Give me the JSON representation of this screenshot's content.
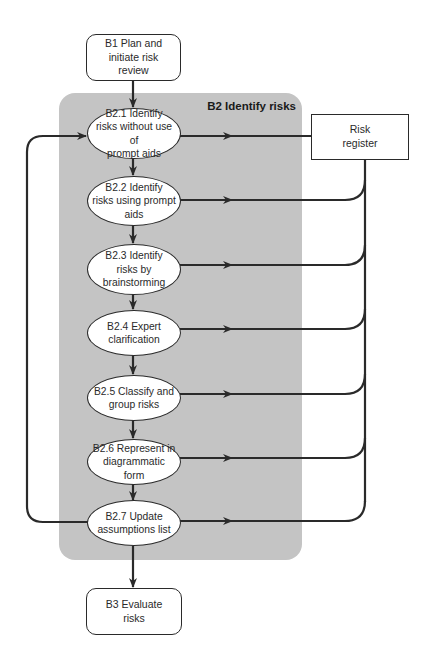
{
  "diagram": {
    "group": {
      "title": "B2 Identify risks",
      "background_color": "#c4c4c4"
    },
    "start_node": {
      "id": "B1",
      "label": "B1 Plan and\ninitiate risk\nreview"
    },
    "end_node": {
      "id": "B3",
      "label": "B3 Evaluate\nrisks"
    },
    "register": {
      "label": "Risk\nregister"
    },
    "steps": [
      {
        "id": "B2.1",
        "label": "B2.1 Identify\nrisks without use of\nprompt aids"
      },
      {
        "id": "B2.2",
        "label": "B2.2 Identify\nrisks using prompt\naids"
      },
      {
        "id": "B2.3",
        "label": "B2.3 Identify\nrisks by\nbrainstorming"
      },
      {
        "id": "B2.4",
        "label": "B2.4 Expert\nclarification"
      },
      {
        "id": "B2.5",
        "label": "B2.5 Classify and\ngroup risks"
      },
      {
        "id": "B2.6",
        "label": "B2.6 Represent in\ndiagrammatic form"
      },
      {
        "id": "B2.7",
        "label": "B2.7 Update\nassumptions list"
      }
    ],
    "edges": [
      {
        "from": "B1",
        "to": "B2.1"
      },
      {
        "from": "B2.1",
        "to": "B2.2"
      },
      {
        "from": "B2.2",
        "to": "B2.3"
      },
      {
        "from": "B2.3",
        "to": "B2.4"
      },
      {
        "from": "B2.4",
        "to": "B2.5"
      },
      {
        "from": "B2.5",
        "to": "B2.6"
      },
      {
        "from": "B2.6",
        "to": "B2.7"
      },
      {
        "from": "B2.7",
        "to": "B3"
      },
      {
        "from": "B2.7",
        "to": "B2.1",
        "type": "loop"
      },
      {
        "from": "B2.1",
        "to": "Risk register"
      },
      {
        "from": "B2.2",
        "to": "Risk register"
      },
      {
        "from": "B2.3",
        "to": "Risk register"
      },
      {
        "from": "B2.4",
        "to": "Risk register"
      },
      {
        "from": "B2.5",
        "to": "Risk register"
      },
      {
        "from": "B2.6",
        "to": "Risk register"
      },
      {
        "from": "B2.7",
        "to": "Risk register"
      }
    ],
    "line_color": "#2a2a2a"
  }
}
